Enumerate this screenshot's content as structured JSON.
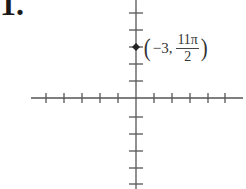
{
  "problem": {
    "number": "1."
  },
  "axes": {
    "color": "#555555",
    "x_axis": {
      "y": 98,
      "x_start": 31,
      "x_end": 243,
      "ticks_x": [
        46,
        64,
        82,
        100,
        118,
        154,
        172,
        190,
        208,
        225
      ]
    },
    "y_axis": {
      "x": 136,
      "y_start": 0,
      "y_end": 189,
      "ticks_y": [
        13,
        30,
        47,
        64,
        81,
        117,
        134,
        151,
        168,
        184
      ]
    }
  },
  "point": {
    "coords": {
      "r": "-3",
      "theta": "11π/2"
    },
    "px": 136,
    "py": 47,
    "color": "#222222",
    "label": {
      "open": "(",
      "r_text": "−3,",
      "num": "11π",
      "den": "2",
      "close": ")"
    }
  }
}
